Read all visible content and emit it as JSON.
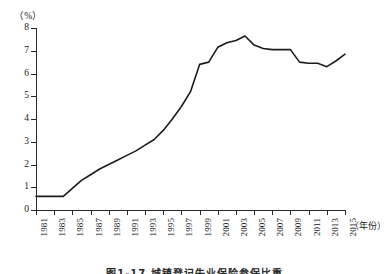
{
  "figure": {
    "caption": "图1-17 城镇登记失业保险参保比重",
    "y_unit_label": "（%）",
    "x_unit_label": "（年份）"
  },
  "chart_data": {
    "type": "line",
    "title": "",
    "xlabel": "（年份）",
    "ylabel": "（%）",
    "xlim": [
      1981,
      2015
    ],
    "ylim": [
      0,
      8
    ],
    "grid": false,
    "legend": null,
    "y_ticks": [
      "0",
      "1",
      "2",
      "3",
      "4",
      "5",
      "6",
      "7",
      "8"
    ],
    "y_tick_values": [
      0,
      1,
      2,
      3,
      4,
      5,
      6,
      7,
      8
    ],
    "x_tick_labels": [
      "1981",
      "1983",
      "1985",
      "1987",
      "1989",
      "1991",
      "1993",
      "1995",
      "1997",
      "1999",
      "2001",
      "2003",
      "2005",
      "2007",
      "2009",
      "2011",
      "2013",
      "2015"
    ],
    "x_tick_values": [
      1981,
      1983,
      1985,
      1987,
      1989,
      1991,
      1993,
      1995,
      1997,
      1999,
      2001,
      2003,
      2005,
      2007,
      2009,
      2011,
      2013,
      2015
    ],
    "series": [
      {
        "name": "比重",
        "color": "#1c1c1c",
        "x": [
          1981,
          1982,
          1983,
          1984,
          1985,
          1986,
          1987,
          1988,
          1989,
          1990,
          1991,
          1992,
          1993,
          1994,
          1995,
          1996,
          1997,
          1998,
          1999,
          2000,
          2001,
          2002,
          2003,
          2004,
          2005,
          2006,
          2007,
          2008,
          2009,
          2010,
          2011,
          2012,
          2013,
          2014,
          2015
        ],
        "values": [
          0.6,
          0.6,
          0.6,
          0.6,
          0.95,
          1.3,
          1.55,
          1.8,
          2.0,
          2.2,
          2.4,
          2.6,
          2.85,
          3.1,
          3.5,
          4.0,
          4.55,
          5.2,
          6.4,
          6.5,
          7.15,
          7.35,
          7.45,
          7.65,
          7.25,
          7.1,
          7.05,
          7.05,
          7.05,
          6.5,
          6.45,
          6.45,
          6.3,
          6.55,
          6.85
        ]
      }
    ]
  }
}
